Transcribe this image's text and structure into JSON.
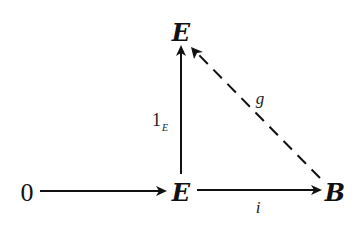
{
  "diagram": {
    "nodes": {
      "top_E": "E",
      "zero": "0",
      "mid_E": "E",
      "B": "B"
    },
    "edges": {
      "identity": {
        "main": "1",
        "subscript": "E",
        "from": "mid_E",
        "to": "top_E",
        "style": "solid"
      },
      "zero_map": {
        "label": "",
        "from": "zero",
        "to": "mid_E",
        "style": "solid"
      },
      "i": {
        "label": "i",
        "from": "mid_E",
        "to": "B",
        "style": "solid"
      },
      "g": {
        "label": "g",
        "from": "B",
        "to": "top_E",
        "style": "dashed"
      }
    }
  }
}
